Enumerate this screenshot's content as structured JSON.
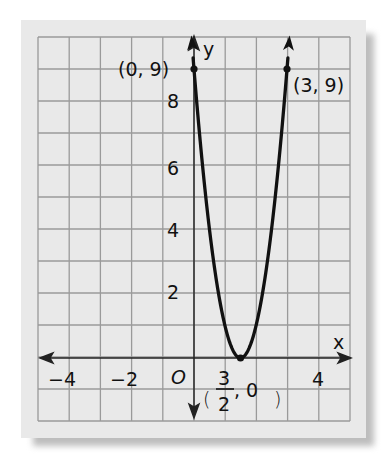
{
  "chart_data": {
    "type": "line",
    "title": "",
    "function": "y = 4x^2 - 12x + 9",
    "xlabel": "x",
    "ylabel": "y",
    "xlim": [
      -5,
      5
    ],
    "ylim": [
      -2,
      10
    ],
    "grid": true,
    "x_tick_labels": [
      "-4",
      "-2",
      "4"
    ],
    "origin_label": "O",
    "y_tick_labels": [
      "2",
      "4",
      "6",
      "8"
    ],
    "points": [
      {
        "x": 0,
        "y": 9,
        "label": "(0, 9)"
      },
      {
        "x": 3,
        "y": 9,
        "label": "(3, 9)"
      },
      {
        "x": 1.5,
        "y": 0,
        "label": "(3/2, 0)"
      }
    ],
    "series": [
      {
        "name": "parabola",
        "x": [
          -0.06,
          0,
          0.5,
          1,
          1.5,
          2,
          2.5,
          3,
          3.06
        ],
        "y": [
          9.73,
          9,
          4,
          1,
          0,
          1,
          4,
          9,
          9.73
        ]
      }
    ]
  },
  "labels": {
    "x_axis": "x",
    "y_axis": "y",
    "origin": "O",
    "x_neg4": "−4",
    "x_neg2": "−2",
    "x_4": "4",
    "y_2": "2",
    "y_4": "4",
    "y_6": "6",
    "y_8": "8",
    "pt_left": "(0, 9)",
    "pt_right": "(3, 9)",
    "vertex_num": "3",
    "vertex_den": "2",
    "vertex_rest": ", 0",
    "vertex_open": "(",
    "vertex_close": ")"
  }
}
